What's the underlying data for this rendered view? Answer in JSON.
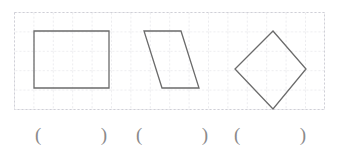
{
  "worksheet": {
    "background_color": "#ffffff",
    "grid": {
      "cell_size": 19.4,
      "line_color": "#d8d8de",
      "line_style": "dashed",
      "border_color": "#cfcfd6",
      "columns": 16,
      "rows": 5,
      "x": 14,
      "y": 12,
      "width": 311,
      "height": 98
    },
    "shape_stroke_color": "#6b6b6b",
    "shape_fill": "none",
    "shape_stroke_width": 1.2
  },
  "shapes": [
    {
      "index": 1,
      "name": "rectangle",
      "label": "rectangle",
      "points": "20,19 95,19 95,76 20,76",
      "vertices": [
        [
          20,
          19
        ],
        [
          95,
          19
        ],
        [
          95,
          76
        ],
        [
          20,
          76
        ]
      ],
      "sides": 4
    },
    {
      "index": 2,
      "name": "parallelogram",
      "label": "parallelogram",
      "points": "130,19 167,19 185,76 148,76",
      "vertices": [
        [
          130,
          19
        ],
        [
          167,
          19
        ],
        [
          185,
          76
        ],
        [
          148,
          76
        ]
      ],
      "sides": 4
    },
    {
      "index": 3,
      "name": "diamond-square",
      "label": "square",
      "points": "259,19 292,57 259,97 221,57",
      "vertices": [
        [
          259,
          19
        ],
        [
          292,
          57
        ],
        [
          259,
          97
        ],
        [
          221,
          57
        ]
      ],
      "sides": 4
    }
  ],
  "answers": {
    "open_paren": "(",
    "close_paren": ")",
    "slots": [
      {
        "id": "answer-1",
        "value": "",
        "open": "(",
        "close": ")"
      },
      {
        "id": "answer-2",
        "value": "",
        "open": "(",
        "close": ")"
      },
      {
        "id": "answer-3",
        "value": "",
        "open": "(",
        "close": ")"
      }
    ]
  }
}
